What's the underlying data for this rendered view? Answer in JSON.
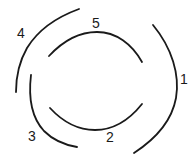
{
  "diagram": {
    "stroke_color": "#1a1a1a",
    "background": "#ffffff",
    "arcs": [
      {
        "id": "1",
        "label": "1",
        "position": "right outer"
      },
      {
        "id": "2",
        "label": "2",
        "position": "bottom inner"
      },
      {
        "id": "3",
        "label": "3",
        "position": "lower-left"
      },
      {
        "id": "4",
        "label": "4",
        "position": "upper-left outer"
      },
      {
        "id": "5",
        "label": "5",
        "position": "top inner"
      }
    ]
  }
}
